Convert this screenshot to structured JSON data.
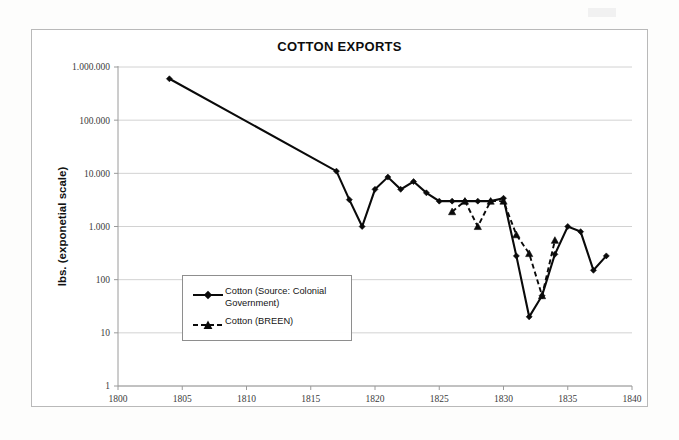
{
  "chart_data": {
    "type": "line",
    "title": "COTTON EXPORTS",
    "xlabel": "",
    "ylabel": "lbs. (exponetial scale)",
    "yscale": "log",
    "ylim": [
      1,
      1000000
    ],
    "xlim": [
      1800,
      1840
    ],
    "grid": true,
    "legend_position": "inside-left",
    "x_ticks": [
      1800,
      1805,
      1810,
      1815,
      1820,
      1825,
      1830,
      1835,
      1840
    ],
    "x_tick_labels": [
      "1800",
      "1805",
      "1810",
      "1815",
      "1820",
      "1825",
      "1830",
      "1835",
      "1840"
    ],
    "y_ticks": [
      1,
      10,
      100,
      1000,
      10000,
      100000,
      1000000
    ],
    "y_tick_labels": [
      "1",
      "10",
      "100",
      "1.000",
      "10.000",
      "100.000",
      "1.000.000"
    ],
    "series": [
      {
        "name": "Cotton (Source: Colonial Government)",
        "style": "solid",
        "marker": "diamond",
        "color": "#0a0a0a",
        "x": [
          1804,
          1817,
          1818,
          1819,
          1820,
          1821,
          1822,
          1823,
          1824,
          1825,
          1826,
          1827,
          1828,
          1829,
          1830,
          1831,
          1832,
          1833,
          1834,
          1835,
          1836,
          1837,
          1838
        ],
        "values": [
          600000,
          11000,
          3200,
          1000,
          5000,
          8500,
          5000,
          7000,
          4300,
          3000,
          3000,
          3000,
          3000,
          3000,
          3400,
          280,
          20,
          50,
          300,
          1000,
          800,
          150,
          280
        ]
      },
      {
        "name": "Cotton (BREEN)",
        "style": "dashed",
        "marker": "triangle",
        "color": "#0a0a0a",
        "x": [
          1826,
          1827,
          1828,
          1829,
          1830,
          1831,
          1832,
          1833,
          1834
        ],
        "values": [
          1900,
          3000,
          1000,
          3000,
          3000,
          700,
          310,
          50,
          550
        ]
      }
    ]
  },
  "legend": {
    "items": [
      {
        "label": "Cotton (Source: Colonial Government)",
        "style": "solid",
        "marker": "diamond"
      },
      {
        "label": "Cotton (BREEN)",
        "style": "dashed",
        "marker": "triangle"
      }
    ]
  }
}
